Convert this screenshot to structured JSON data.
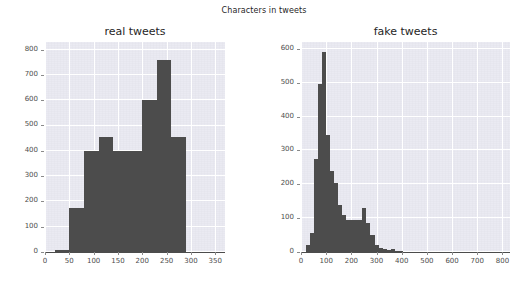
{
  "figure": {
    "suptitle": "Characters in tweets",
    "background_color": "#ffffff",
    "axes_background_color": "#eaeaf2",
    "bar_color": "#4c4c4c",
    "grid_color": "#ffffff",
    "tick_label_color": "#4d4d4d"
  },
  "chart_data": [
    {
      "type": "bar",
      "subplot": "left",
      "title": "real tweets",
      "xlabel": "",
      "ylabel": "",
      "xlim": [
        0,
        370
      ],
      "ylim": [
        0,
        830
      ],
      "grid": true,
      "legend": null,
      "xticks": [
        0,
        50,
        100,
        150,
        200,
        250,
        300,
        350
      ],
      "yticks": [
        0,
        100,
        200,
        300,
        400,
        500,
        600,
        700,
        800
      ],
      "bin_edges": [
        20,
        50,
        80,
        110,
        140,
        170,
        200,
        230,
        260,
        290
      ],
      "categories": [
        "20-50",
        "50-80",
        "80-110",
        "110-140",
        "140-170",
        "170-200",
        "200-230",
        "230-260",
        "260-290"
      ],
      "values": [
        8,
        175,
        400,
        455,
        400,
        400,
        600,
        760,
        455
      ]
    },
    {
      "type": "bar",
      "subplot": "right",
      "title": "fake tweets",
      "xlabel": "",
      "ylabel": "",
      "xlim": [
        0,
        830
      ],
      "ylim": [
        0,
        620
      ],
      "grid": true,
      "legend": null,
      "xticks": [
        0,
        100,
        200,
        300,
        400,
        500,
        600,
        700,
        800
      ],
      "yticks": [
        0,
        100,
        200,
        300,
        400,
        500,
        600
      ],
      "bin_edges": [
        20,
        36,
        52,
        68,
        84,
        100,
        116,
        132,
        148,
        164,
        180,
        196,
        212,
        228,
        244,
        260,
        276,
        292,
        308,
        324,
        340,
        356,
        372,
        388,
        404
      ],
      "categories": [
        "20-36",
        "36-52",
        "52-68",
        "68-84",
        "84-100",
        "100-116",
        "116-132",
        "132-148",
        "148-164",
        "164-180",
        "180-196",
        "196-212",
        "212-228",
        "228-244",
        "244-260",
        "260-276",
        "276-292",
        "292-308",
        "308-324",
        "324-340",
        "340-356",
        "356-372",
        "372-388",
        "388-404"
      ],
      "values": [
        22,
        55,
        275,
        495,
        590,
        345,
        240,
        205,
        140,
        110,
        95,
        95,
        95,
        95,
        130,
        85,
        50,
        22,
        12,
        8,
        6,
        10,
        4,
        3
      ]
    }
  ]
}
